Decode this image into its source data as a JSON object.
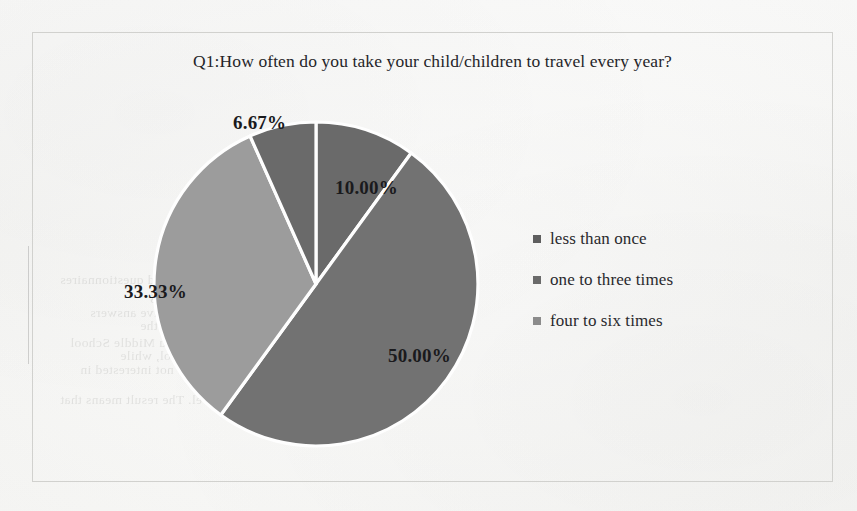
{
  "document": {
    "background_color": "#fbfbfa",
    "frame_border_color": "#d2d2cf",
    "bleed_through_lines": [
      {
        "text": "Result of Survey",
        "left": 330,
        "top": 190
      },
      {
        "text": "two hundred questionnaires",
        "left": 60,
        "top": 272
      },
      {
        "text": "have been sent out to the parents, including",
        "left": 150,
        "top": 288
      },
      {
        "text": "effective answers",
        "left": 90,
        "top": 305
      },
      {
        "text": "students are from three different schools, the",
        "left": 140,
        "top": 318
      },
      {
        "text": "one sample the Jiuzhou Middle School",
        "left": 70,
        "top": 335
      },
      {
        "text": "one is the Dongpo Primary School, while",
        "left": 120,
        "top": 348
      },
      {
        "text": "they are not interested in",
        "left": 80,
        "top": 362
      },
      {
        "text": "and students give different",
        "left": 290,
        "top": 375
      },
      {
        "text": "answers as to the way they may travel. The result means that",
        "left": 60,
        "top": 392
      }
    ]
  },
  "chart": {
    "title": "Q1:How often do you take your child/children to travel every year?"
  },
  "chart_data": {
    "type": "pie",
    "title": "Q1:How often do you take your child/children to travel every year?",
    "xlabel": "",
    "ylabel": "",
    "start_angle_deg": 0,
    "direction": "clockwise",
    "legend_position": "right",
    "grid": false,
    "explode": false,
    "labels": [
      "10.00%",
      "50.00%",
      "33.33%",
      "6.67%"
    ],
    "values": [
      10.0,
      50.0,
      33.33,
      6.67
    ],
    "slice_colors": [
      "#6b6b6b",
      "#737373",
      "#9d9d9d",
      "#6b6b6b"
    ],
    "slice_border_color": "#ffffff",
    "categories": [
      "less than once",
      "one to three times",
      "four to six times",
      "six times or more"
    ],
    "legend_entries": [
      {
        "label": "less than once",
        "color": "#5f5f5f"
      },
      {
        "label": "one to three times",
        "color": "#6b6b6b"
      },
      {
        "label": "four to six times",
        "color": "#8c8c8c"
      }
    ],
    "slices": [
      {
        "label": "10.00%",
        "value": 10.0,
        "color": "#6b6b6b",
        "label_left": 302,
        "label_top": 144
      },
      {
        "label": "50.00%",
        "value": 50.0,
        "color": "#737373",
        "label_left": 355,
        "label_top": 312
      },
      {
        "label": "33.33%",
        "value": 33.33,
        "color": "#9d9d9d",
        "label_left": 91,
        "label_top": 248
      },
      {
        "label": "6.67%",
        "value": 6.67,
        "color": "#6b6b6b",
        "label_left": 200,
        "label_top": 79
      }
    ]
  }
}
